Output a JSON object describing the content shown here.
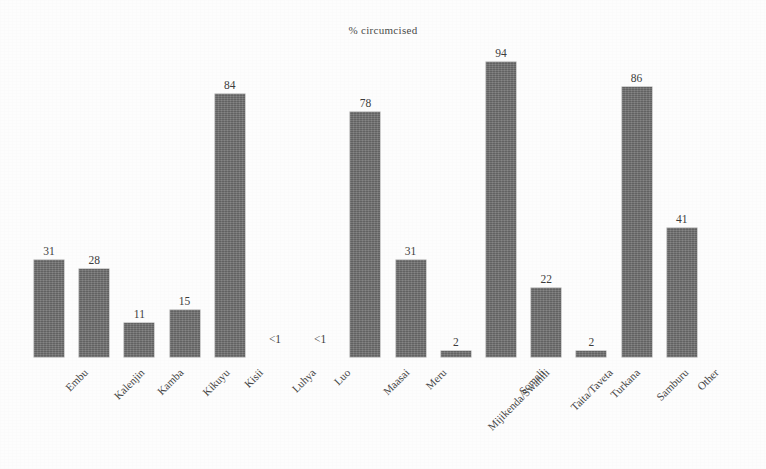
{
  "chart_data": {
    "type": "bar",
    "title": "% circumcised",
    "xlabel": "",
    "ylabel": "",
    "ylim": [
      0,
      100
    ],
    "grid": false,
    "legend": "none",
    "orientation": "vertical",
    "categories": [
      "Embu",
      "Kalenjin",
      "Kamba",
      "Kikuyu",
      "Kisii",
      "Luhya",
      "Luo",
      "Maasai",
      "Meru",
      "Mijikenda/Swahili",
      "Somali",
      "Taita/Taveta",
      "Turkana",
      "Samburu",
      "Other"
    ],
    "values": [
      31,
      28,
      11,
      15,
      84,
      0.4,
      0.4,
      78,
      31,
      2,
      94,
      22,
      2,
      86,
      41
    ],
    "value_labels": [
      "31",
      "28",
      "11",
      "15",
      "84",
      "<1",
      "<1",
      "78",
      "31",
      "2",
      "94",
      "22",
      "2",
      "86",
      "41"
    ],
    "bar_color": "#6e6e6e",
    "background_color": "#fdfdfd"
  }
}
